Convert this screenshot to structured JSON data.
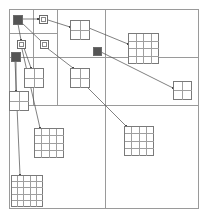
{
  "figure": {
    "title": "Quadtree spatial partition with linked grid blocks",
    "background": "#ffffff",
    "width": 207,
    "height": 217,
    "colors": {
      "partition_line": "#9a9a9a",
      "node_outline": "#6b6b6b",
      "node_fill_open": "#ffffff",
      "node_fill_solid": "#555555",
      "grid_outline": "#7a7a7a",
      "grid_cell_line": "#9f9f9f",
      "link_line": "#4a4a4a"
    },
    "outer_frame": {
      "x": 9,
      "y": 9,
      "width": 189,
      "height": 199,
      "stroke": "#9a9a9a"
    }
  },
  "chart_data": {
    "type": "diagram",
    "title": "Quadtree spatial partition with linked grid blocks",
    "xlabel": "",
    "ylabel": "",
    "xlim": [
      0,
      207
    ],
    "ylim": [
      0,
      217
    ],
    "grid": false,
    "legend": false,
    "partitions": [
      {
        "name": "root",
        "x": 9,
        "y": 9,
        "width": 189,
        "height": 199
      },
      {
        "name": "quad-top-left",
        "x": 9,
        "y": 9,
        "width": 96,
        "height": 96
      },
      {
        "name": "quad-bottom-left",
        "x": 9,
        "y": 105,
        "width": 96,
        "height": 103
      },
      {
        "name": "quad-top-right",
        "x": 105,
        "y": 9,
        "width": 93,
        "height": 96
      },
      {
        "name": "quad-bottom-right",
        "x": 105,
        "y": 105,
        "width": 93,
        "height": 103
      },
      {
        "name": "sub-tl-a",
        "x": 9,
        "y": 9,
        "width": 48,
        "height": 48
      },
      {
        "name": "sub-tl-b",
        "x": 57,
        "y": 9,
        "width": 48,
        "height": 48
      },
      {
        "name": "sub-tl-c",
        "x": 9,
        "y": 57,
        "width": 48,
        "height": 48
      },
      {
        "name": "sub-tl-d",
        "x": 57,
        "y": 57,
        "width": 48,
        "height": 48
      },
      {
        "name": "sub-tl-a1",
        "x": 9,
        "y": 9,
        "width": 24,
        "height": 24
      },
      {
        "name": "sub-tl-a2",
        "x": 33,
        "y": 9,
        "width": 24,
        "height": 24
      },
      {
        "name": "sub-tl-a3",
        "x": 9,
        "y": 33,
        "width": 24,
        "height": 24
      },
      {
        "name": "sub-tl-a4",
        "x": 33,
        "y": 33,
        "width": 24,
        "height": 24
      },
      {
        "name": "sub-tr-top",
        "x": 105,
        "y": 9,
        "width": 93,
        "height": 48
      },
      {
        "name": "sub-left-strip",
        "x": 9,
        "y": 9,
        "width": 24,
        "height": 96
      }
    ],
    "nodes": [
      {
        "id": "n1",
        "name": "solid-node-root",
        "kind": "solid",
        "cx": 17,
        "cy": 19,
        "size": 9
      },
      {
        "id": "n2",
        "name": "open-node-a",
        "kind": "open",
        "cx": 43,
        "cy": 19,
        "size": 8
      },
      {
        "id": "n3",
        "name": "open-node-b",
        "kind": "open",
        "cx": 21,
        "cy": 44,
        "size": 8
      },
      {
        "id": "n4",
        "name": "open-node-c",
        "kind": "open",
        "cx": 44,
        "cy": 44,
        "size": 8
      },
      {
        "id": "n5",
        "name": "solid-node-left",
        "kind": "solid",
        "cx": 15,
        "cy": 56,
        "size": 9
      },
      {
        "id": "n6",
        "name": "solid-node-mid",
        "kind": "solid",
        "cx": 97,
        "cy": 51,
        "size": 8
      }
    ],
    "grid_blocks": [
      {
        "id": "g1",
        "name": "grid-block-top-mid",
        "x": 70,
        "y": 20,
        "size": 19,
        "cells": 2
      },
      {
        "id": "g2",
        "name": "grid-block-top-right",
        "x": 128,
        "y": 33,
        "size": 30,
        "cells": 4
      },
      {
        "id": "g3",
        "name": "grid-block-far-right",
        "x": 173,
        "y": 81,
        "size": 18,
        "cells": 2
      },
      {
        "id": "g4",
        "name": "grid-block-mid-left",
        "x": 24,
        "y": 68,
        "size": 19,
        "cells": 2
      },
      {
        "id": "g5",
        "name": "grid-block-mid-center",
        "x": 70,
        "y": 68,
        "size": 19,
        "cells": 2
      },
      {
        "id": "g6",
        "name": "grid-block-left-edge",
        "x": 9,
        "y": 91,
        "size": 19,
        "cells": 2
      },
      {
        "id": "g7",
        "name": "grid-block-lower-left",
        "x": 34,
        "y": 128,
        "size": 29,
        "cells": 4
      },
      {
        "id": "g8",
        "name": "grid-block-lower-right",
        "x": 124,
        "y": 126,
        "size": 29,
        "cells": 4
      },
      {
        "id": "g9",
        "name": "grid-block-bottom-left",
        "x": 11,
        "y": 175,
        "size": 31,
        "cells": 5
      }
    ],
    "links": [
      {
        "name": "link-root-to-open-a",
        "from": [
          22,
          19
        ],
        "to": [
          38,
          19
        ]
      },
      {
        "name": "link-root-to-open-b",
        "from": [
          18,
          24
        ],
        "to": [
          21,
          40
        ]
      },
      {
        "name": "link-root-to-open-c",
        "from": [
          22,
          23
        ],
        "to": [
          41,
          41
        ]
      },
      {
        "name": "link-open-a-to-grid-top",
        "from": [
          48,
          20
        ],
        "to": [
          70,
          27
        ]
      },
      {
        "name": "link-grid-top-to-top-right",
        "from": [
          89,
          28
        ],
        "to": [
          128,
          44
        ]
      },
      {
        "name": "link-open-c-to-mid-center",
        "from": [
          47,
          48
        ],
        "to": [
          73,
          68
        ]
      },
      {
        "name": "link-solid-mid-to-far-right",
        "from": [
          101,
          52
        ],
        "to": [
          173,
          88
        ]
      },
      {
        "name": "link-open-b-to-mid-left",
        "from": [
          24,
          48
        ],
        "to": [
          31,
          68
        ]
      },
      {
        "name": "link-solid-left-to-left-edge",
        "from": [
          16,
          61
        ],
        "to": [
          16,
          91
        ]
      },
      {
        "name": "link-open-b-to-lower-left",
        "from": [
          22,
          49
        ],
        "to": [
          40,
          128
        ]
      },
      {
        "name": "link-mid-center-to-lower-right",
        "from": [
          84,
          84
        ],
        "to": [
          126,
          126
        ]
      },
      {
        "name": "link-solid-left-to-bottom-left",
        "from": [
          15,
          61
        ],
        "to": [
          20,
          175
        ]
      }
    ]
  }
}
